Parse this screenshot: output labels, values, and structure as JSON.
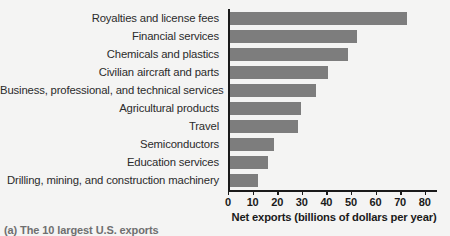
{
  "chart_data": {
    "type": "bar",
    "orientation": "horizontal",
    "title": "",
    "xlabel": "Net exports (billions of dollars per year)",
    "ylabel": "",
    "xlim": [
      0,
      85
    ],
    "xticks": [
      "0",
      "10",
      "20",
      "30",
      "40",
      "50",
      "60",
      "70",
      "80"
    ],
    "xtick_values": [
      0,
      10,
      20,
      30,
      40,
      50,
      60,
      70,
      80
    ],
    "grid": false,
    "legend": false,
    "bar_color": "#7d7d7d",
    "axis_color": "#1a1a1a",
    "background_color": "#f4f4f3",
    "categories": [
      "Royalties and license fees",
      "Financial services",
      "Chemicals and plastics",
      "Civilian aircraft and parts",
      "Business, professional, and technical services",
      "Agricultural products",
      "Travel",
      "Semiconductors",
      "Education services",
      "Drilling, mining, and construction machinery"
    ],
    "values": [
      72,
      52,
      48,
      40,
      35,
      29,
      28,
      18,
      15.5,
      11.5
    ]
  },
  "caption": {
    "text": "(a) The 10 largest U.S. exports"
  }
}
